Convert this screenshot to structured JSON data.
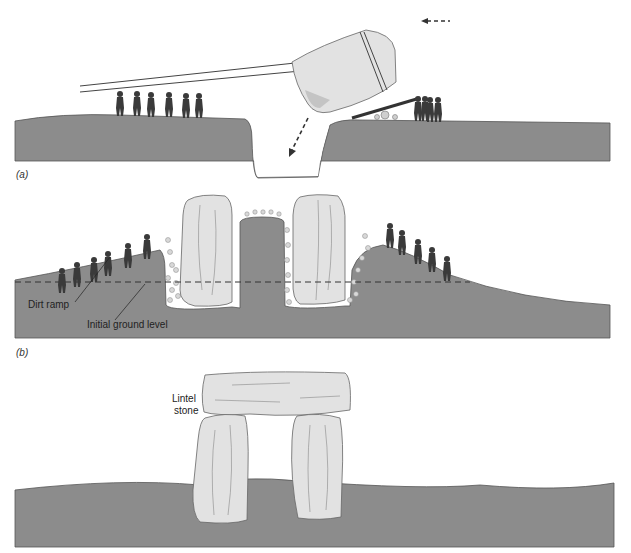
{
  "figure": {
    "panels": [
      {
        "id": "a",
        "label": "(a)",
        "description": "Workers pull a tilted stone with ropes into a pit while others lever it from behind",
        "arrows": [
          "tipping-into-pit",
          "push-direction"
        ]
      },
      {
        "id": "b",
        "label": "(b)",
        "description": "Uprights standing in pits; dirt ramps built up around them",
        "annotations": [
          "Dirt ramp",
          "Initial ground level"
        ]
      },
      {
        "id": "c",
        "label": "",
        "description": "Completed trilithon with lintel stone on top of two uprights",
        "annotations": [
          "Lintel stone"
        ]
      }
    ],
    "annotations": {
      "dirt_ramp": "Dirt ramp",
      "initial_ground_level": "Initial ground level",
      "lintel_line1": "Lintel",
      "lintel_line2": "stone"
    },
    "colors": {
      "ground": "#8c8c8c",
      "ground_edge": "#555555",
      "stone": "#e2e2e2",
      "stone_shadow": "#c4c4c4",
      "figure": "#3a3a3a",
      "rubble": "#d0d0d0"
    }
  }
}
